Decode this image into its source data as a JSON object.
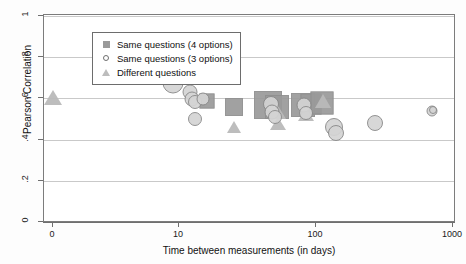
{
  "chart_data": {
    "type": "scatter",
    "title": "",
    "xlabel": "Time between measurements (in days)",
    "ylabel": "Pearson Correlation",
    "xscale": "log",
    "xlim": [
      0,
      1000
    ],
    "ylim": [
      0,
      1
    ],
    "grid": true,
    "xticks": [
      "0",
      "10",
      "100",
      "1000"
    ],
    "xtick_values": [
      0,
      10,
      100,
      1000
    ],
    "yticks": [
      "0",
      ".2",
      ".4",
      ".6",
      ".8",
      "1"
    ],
    "ytick_values": [
      0,
      0.2,
      0.4,
      0.6,
      0.8,
      1
    ],
    "legend_position": "upper-left",
    "legend": [
      {
        "label": "Same questions (4 options)",
        "marker": "square"
      },
      {
        "label": "Same questions (3 options)",
        "marker": "circle"
      },
      {
        "label": "Different questions",
        "marker": "triangle"
      }
    ],
    "series": [
      {
        "name": "Same questions (4 options)",
        "marker": "square",
        "points": [
          {
            "x": 16,
            "y": 0.585,
            "size": 13
          },
          {
            "x": 25,
            "y": 0.558,
            "size": 16
          },
          {
            "x": 45,
            "y": 0.57,
            "size": 26
          },
          {
            "x": 52,
            "y": 0.56,
            "size": 22
          },
          {
            "x": 80,
            "y": 0.568,
            "size": 22
          },
          {
            "x": 92,
            "y": 0.572,
            "size": 19
          },
          {
            "x": 110,
            "y": 0.578,
            "size": 21
          }
        ]
      },
      {
        "name": "Same questions (3 options)",
        "marker": "circle",
        "points": [
          {
            "x": 9,
            "y": 0.673,
            "size": 19
          },
          {
            "x": 12,
            "y": 0.633,
            "size": 13
          },
          {
            "x": 12.5,
            "y": 0.598,
            "size": 13
          },
          {
            "x": 13,
            "y": 0.583,
            "size": 12
          },
          {
            "x": 15,
            "y": 0.596,
            "size": 11
          },
          {
            "x": 13,
            "y": 0.498,
            "size": 12
          },
          {
            "x": 47,
            "y": 0.575,
            "size": 14
          },
          {
            "x": 48,
            "y": 0.532,
            "size": 13
          },
          {
            "x": 50,
            "y": 0.512,
            "size": 12
          },
          {
            "x": 82,
            "y": 0.57,
            "size": 13
          },
          {
            "x": 84,
            "y": 0.527,
            "size": 12
          },
          {
            "x": 135,
            "y": 0.462,
            "size": 16
          },
          {
            "x": 140,
            "y": 0.432,
            "size": 14
          },
          {
            "x": 270,
            "y": 0.483,
            "size": 14
          },
          {
            "x": 700,
            "y": 0.54,
            "size": 9
          },
          {
            "x": 710,
            "y": 0.545,
            "size": 6
          }
        ]
      },
      {
        "name": "Different questions",
        "marker": "triangle",
        "points": [
          {
            "x": 0,
            "y": 0.603,
            "size": 15
          },
          {
            "x": 25,
            "y": 0.462,
            "size": 12
          },
          {
            "x": 52,
            "y": 0.538,
            "size": 15
          },
          {
            "x": 53,
            "y": 0.478,
            "size": 13
          },
          {
            "x": 85,
            "y": 0.52,
            "size": 13
          },
          {
            "x": 113,
            "y": 0.585,
            "size": 14
          }
        ]
      }
    ]
  }
}
